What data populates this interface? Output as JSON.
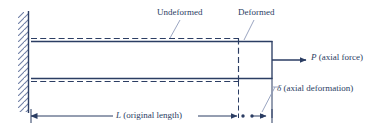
{
  "figure": {
    "width": 379,
    "height": 131,
    "background": "#ffffff",
    "line_color": "#2b3d63",
    "hatch_color": "#6f7fa6",
    "text_color": "#2b3d63"
  },
  "labels": {
    "undeformed": "Undeformed",
    "deformed": "Deformed",
    "axial_force": "P (axial force)",
    "axial_force_symbol": "P",
    "axial_force_note": "(axial force)",
    "axial_deformation": "δ (axial deformation)",
    "axial_deformation_symbol": "δ",
    "axial_deformation_note": "(axial deformation)",
    "original_length": "L (original length)",
    "original_length_symbol": "L",
    "original_length_note": "(original length)"
  },
  "geometry": {
    "wall_x": 28,
    "wall_top": 12,
    "wall_bottom": 112,
    "bar_left": 31,
    "bar_top_solid": 41,
    "bar_bottom_solid": 79,
    "bar_top_dashed": 38,
    "bar_bottom_dashed": 82,
    "undeformed_right": 238,
    "deformed_right": 272,
    "force_arrow_start": 272,
    "force_arrow_end": 307,
    "force_arrow_y": 60,
    "dimension_line_y": 116,
    "delta_left": 248,
    "delta_right": 266
  }
}
